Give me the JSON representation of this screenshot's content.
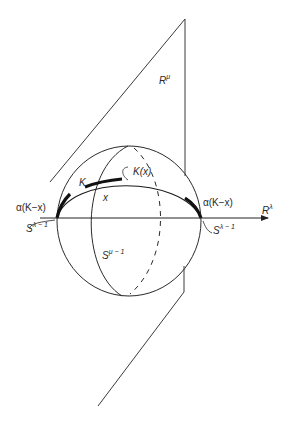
{
  "figure": {
    "type": "topology-diagram",
    "colors": {
      "line": "#3a3a3a",
      "thick": "#111111",
      "background": "#ffffff"
    }
  },
  "labels": {
    "plane": {
      "base": "R",
      "sup": "μ"
    },
    "axis": {
      "base": "R",
      "sup": "λ"
    },
    "K": "K",
    "x": "x",
    "K_of_x": "K(x)",
    "alpha_left": "α(K−x)",
    "alpha_right": "α(K−x)",
    "s_lambda_left": {
      "base": "S",
      "sup": "λ − 1"
    },
    "s_lambda_right": {
      "base": "S",
      "sup": "λ − 1"
    },
    "s_mu": {
      "base": "S",
      "sup": "μ − 1"
    }
  }
}
